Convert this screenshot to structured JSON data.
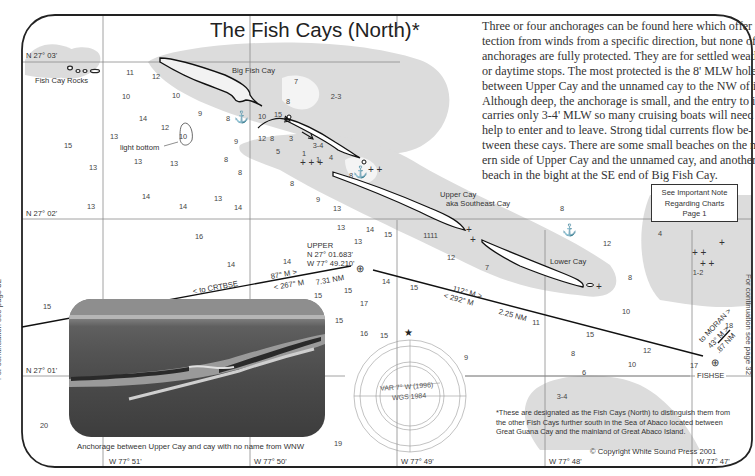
{
  "page": {
    "title": "The Fish Cays (North)*",
    "description_lines": [
      "Three or four anchorages can be found here which offer pro-",
      "tection from winds from a specific direction, but none of the",
      "anchorages are fully protected. They are for settled weather",
      "or daytime stops. The most protected is the 8' MLW hole",
      "between Upper Cay and the unnamed cay to the NW of it.",
      "Although deep, the anchorage is small, and the entry to it",
      "carries only 3-4' MLW so many cruising boats will need tide",
      "help to enter and to leave. Strong tidal currents flow be-",
      "tween these cays. There are some small beaches on the north-",
      "ern side of Upper Cay and the unnamed cay, and another",
      "beach in the bight at the SE end of Big Fish Cay."
    ],
    "note_box": [
      "See Important Note",
      "Regarding Charts",
      "Page 1"
    ],
    "footnote": "*These are designated as the Fish Cays (North) to distinguish them from the other Fish Cays further south in the Sea of Abaco located between Great Guana Cay and the mainland of Great Abaco Island.",
    "copyright": "© Copyright White Sound Press 2001",
    "continuation_left": "For continuation see page 32",
    "continuation_right": "For continuation see page 32"
  },
  "latitudes": [
    "N 27° 03'",
    "N 27° 02'",
    "N 27° 01'"
  ],
  "longitudes": [
    "W 77° 51'",
    "W 77° 50'",
    "W 77° 49'",
    "W 77° 48'",
    "W 77° 47'"
  ],
  "features": {
    "fish_cay_rocks": "Fish Cay Rocks",
    "big_fish_cay": "Big Fish Cay",
    "upper_cay": "Upper Cay",
    "upper_cay_aka": "aka Southeast Cay",
    "lower_cay": "Lower Cay",
    "light_bottom": "light bottom"
  },
  "waypoints": {
    "upper_name": "UPPER",
    "upper_lat": "N 27° 01.683'",
    "upper_lon": "W 77° 49.210'",
    "fishse": "FISHSE"
  },
  "routes": {
    "to_crtbse": "< to CRTBSE",
    "crtbse_bearing_out": "87° M >",
    "crtbse_bearing_in": "< 267° M",
    "crtbse_distance": "7.31 NM",
    "upper_fishse_out": "112° M >",
    "upper_fishse_in": "< 292° M",
    "upper_fishse_distance": "2.25 NM",
    "to_moran": "to MORAN >",
    "moran_bearing": "43° M >",
    "moran_distance": ".87 NM"
  },
  "compass": {
    "variation": "VAR 7° W (1996)",
    "datum": "WGS 1984"
  },
  "photo": {
    "caption": "Anchorage between Upper Cay and cay with no name from WNW"
  },
  "soundings": [
    {
      "v": "11",
      "x": 130,
      "y": 72
    },
    {
      "v": "12",
      "x": 156,
      "y": 76
    },
    {
      "v": "10",
      "x": 126,
      "y": 96
    },
    {
      "v": "10",
      "x": 176,
      "y": 95
    },
    {
      "v": "7",
      "x": 296,
      "y": 81
    },
    {
      "v": "8",
      "x": 288,
      "y": 101
    },
    {
      "v": "2-3",
      "x": 336,
      "y": 96
    },
    {
      "v": "14",
      "x": 143,
      "y": 118
    },
    {
      "v": "9",
      "x": 200,
      "y": 113
    },
    {
      "v": "8",
      "x": 228,
      "y": 118
    },
    {
      "v": "10",
      "x": 262,
      "y": 116
    },
    {
      "v": "15",
      "x": 278,
      "y": 114
    },
    {
      "v": "12",
      "x": 165,
      "y": 127
    },
    {
      "v": "13",
      "x": 114,
      "y": 136
    },
    {
      "v": "15",
      "x": 68,
      "y": 145
    },
    {
      "v": "9",
      "x": 236,
      "y": 141
    },
    {
      "v": "12",
      "x": 262,
      "y": 138
    },
    {
      "v": "8",
      "x": 272,
      "y": 138
    },
    {
      "v": "3",
      "x": 291,
      "y": 138
    },
    {
      "v": "5",
      "x": 278,
      "y": 151
    },
    {
      "v": "13",
      "x": 138,
      "y": 161
    },
    {
      "v": "13",
      "x": 174,
      "y": 163
    },
    {
      "v": "8",
      "x": 226,
      "y": 159
    },
    {
      "v": "8",
      "x": 240,
      "y": 172
    },
    {
      "v": "13",
      "x": 93,
      "y": 167
    },
    {
      "v": "8",
      "x": 292,
      "y": 183
    },
    {
      "v": "14",
      "x": 146,
      "y": 196
    },
    {
      "v": "14",
      "x": 183,
      "y": 206
    },
    {
      "v": "13",
      "x": 218,
      "y": 198
    },
    {
      "v": "14",
      "x": 238,
      "y": 207
    },
    {
      "v": "9",
      "x": 318,
      "y": 199
    },
    {
      "v": "13",
      "x": 337,
      "y": 208
    },
    {
      "v": "13",
      "x": 91,
      "y": 206
    },
    {
      "v": "8",
      "x": 351,
      "y": 175
    },
    {
      "v": "3-4",
      "x": 318,
      "y": 145
    },
    {
      "v": "1",
      "x": 304,
      "y": 153
    },
    {
      "v": "4",
      "x": 331,
      "y": 157
    },
    {
      "v": "1",
      "x": 318,
      "y": 159
    },
    {
      "v": "16",
      "x": 199,
      "y": 236
    },
    {
      "v": "13",
      "x": 341,
      "y": 227
    },
    {
      "v": "14",
      "x": 370,
      "y": 229
    },
    {
      "v": "15",
      "x": 388,
      "y": 234
    },
    {
      "v": "13",
      "x": 358,
      "y": 241
    },
    {
      "v": "11",
      "x": 434,
      "y": 235
    },
    {
      "v": "12",
      "x": 451,
      "y": 257
    },
    {
      "v": "7",
      "x": 487,
      "y": 267
    },
    {
      "v": "14",
      "x": 231,
      "y": 264
    },
    {
      "v": "14",
      "x": 287,
      "y": 261
    },
    {
      "v": "14",
      "x": 386,
      "y": 281
    },
    {
      "v": "15",
      "x": 414,
      "y": 287
    },
    {
      "v": "15",
      "x": 348,
      "y": 290
    },
    {
      "v": "15",
      "x": 318,
      "y": 295
    },
    {
      "v": "17",
      "x": 364,
      "y": 303
    },
    {
      "v": "15",
      "x": 339,
      "y": 320
    },
    {
      "v": "16",
      "x": 364,
      "y": 333
    },
    {
      "v": "15",
      "x": 47,
      "y": 306
    },
    {
      "v": "20",
      "x": 44,
      "y": 425
    },
    {
      "v": "19",
      "x": 338,
      "y": 443
    },
    {
      "v": "9",
      "x": 466,
      "y": 357
    },
    {
      "v": "8",
      "x": 562,
      "y": 208
    },
    {
      "v": "11",
      "x": 427,
      "y": 235
    },
    {
      "v": "12",
      "x": 607,
      "y": 243
    },
    {
      "v": "4",
      "x": 660,
      "y": 233
    },
    {
      "v": "8",
      "x": 630,
      "y": 277
    },
    {
      "v": "1-2",
      "x": 698,
      "y": 272
    },
    {
      "v": "10",
      "x": 626,
      "y": 311
    },
    {
      "v": "15",
      "x": 590,
      "y": 334
    },
    {
      "v": "8",
      "x": 573,
      "y": 353
    },
    {
      "v": "12",
      "x": 647,
      "y": 350
    },
    {
      "v": "10",
      "x": 632,
      "y": 364
    },
    {
      "v": "17",
      "x": 694,
      "y": 365
    },
    {
      "v": "18",
      "x": 729,
      "y": 325
    },
    {
      "v": "6",
      "x": 584,
      "y": 372
    },
    {
      "v": "3-4",
      "x": 562,
      "y": 396
    },
    {
      "v": "11",
      "x": 536,
      "y": 322
    },
    {
      "v": "15",
      "x": 384,
      "y": 335
    }
  ],
  "icons": {
    "anchor": "⚓",
    "waypoint": "⊕",
    "star": "★"
  }
}
